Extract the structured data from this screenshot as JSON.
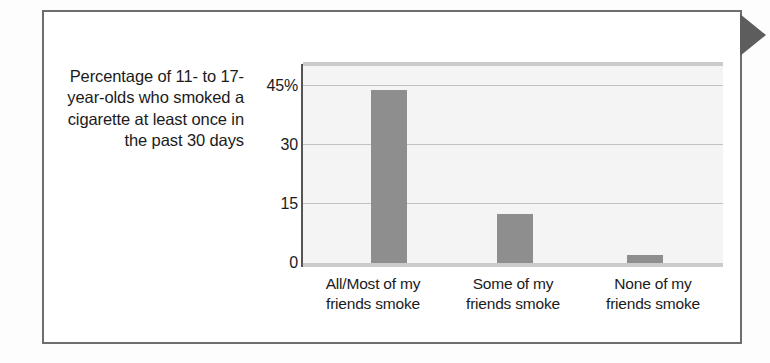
{
  "figure": {
    "frame_border_color": "#6e6e6e",
    "side_tab_color": "#5d5d5d",
    "background": "#ffffff"
  },
  "chart_data": {
    "type": "bar",
    "title": "",
    "subtitle": "",
    "ylabel": "Percentage of 11- to 17-year-olds who smoked a cigarette at least once in the past 30 days",
    "xlabel": "",
    "categories": [
      "All/Most of my friends smoke",
      "Some of my friends smoke",
      "None of my friends smoke"
    ],
    "category_lines": [
      [
        "All/Most of my",
        "friends smoke"
      ],
      [
        "Some of my",
        "friends smoke"
      ],
      [
        "None of my",
        "friends smoke"
      ]
    ],
    "values": [
      44,
      12.5,
      2
    ],
    "ylim": [
      0,
      51
    ],
    "yticks": [
      0,
      15,
      30,
      45
    ],
    "ytick_labels": [
      "0",
      "15",
      "30",
      "45%"
    ],
    "grid": true,
    "legend": "none",
    "bar_color": "#8e8e8e",
    "plot_background": "#f4f4f4",
    "gridline_color": "#c2c2c2"
  },
  "caption": {
    "lines": [
      "Percentage of",
      "11- to 17-year-olds",
      "who smoked a",
      "cigarette at least",
      "once in the past",
      "30 days"
    ],
    "full_text": "Percentage of 11- to 17-year-olds who smoked a cigarette at least once in the past 30 days"
  }
}
